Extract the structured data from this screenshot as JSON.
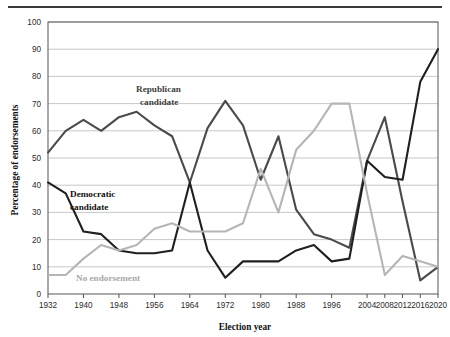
{
  "chart_data": {
    "type": "line",
    "title": "",
    "xlabel": "Election year",
    "ylabel": "Percentage of endorsements",
    "ylim": [
      0,
      100
    ],
    "ytick_step": 10,
    "yticks": [
      0,
      10,
      20,
      30,
      40,
      50,
      60,
      70,
      80,
      90,
      100
    ],
    "grid": true,
    "legend_position": "inline-annotations",
    "x": [
      1932,
      1936,
      1940,
      1944,
      1948,
      1952,
      1956,
      1960,
      1964,
      1968,
      1972,
      1976,
      1980,
      1984,
      1988,
      1992,
      1996,
      2000,
      2004,
      2008,
      2012,
      2016,
      2020
    ],
    "xticks": [
      1932,
      1940,
      1948,
      1956,
      1964,
      1972,
      1980,
      1988,
      1996,
      2004,
      2008,
      2012,
      2016,
      2020
    ],
    "xtick_labels": [
      "1932",
      "1940",
      "1948",
      "1956",
      "1964",
      "1972",
      "1980",
      "1988",
      "1996",
      "2004",
      "2008",
      "2012",
      "2016",
      "2020"
    ],
    "series": [
      {
        "name": "Republican candidate",
        "color": "#4a4a4a",
        "values": [
          52,
          60,
          64,
          60,
          65,
          67,
          62,
          58,
          41,
          61,
          71,
          62,
          42,
          58,
          31,
          22,
          20,
          17,
          49,
          65,
          34,
          5,
          10
        ]
      },
      {
        "name": "Democratic candidate",
        "color": "#1f1f1f",
        "values": [
          41,
          37,
          23,
          22,
          16,
          15,
          15,
          16,
          41,
          16,
          6,
          12,
          12,
          12,
          16,
          18,
          12,
          13,
          49,
          43,
          42,
          78,
          90
        ]
      },
      {
        "name": "No endorsement",
        "color": "#b5b5b5",
        "values": [
          7,
          7,
          13,
          18,
          16,
          18,
          24,
          26,
          23,
          23,
          23,
          26,
          46,
          30,
          53,
          60,
          70,
          70,
          37,
          7,
          14,
          12,
          10
        ]
      }
    ],
    "annotations": [
      {
        "text": "Republican candidate",
        "series": "Republican candidate"
      },
      {
        "text": "Democratic candidate",
        "series": "Democratic candidate"
      },
      {
        "text": "No endorsement",
        "series": "No endorsement"
      }
    ]
  },
  "axis": {
    "y_title": "Percentage of endorsements",
    "x_title": "Election year"
  },
  "labels": {
    "republican_line1": "Republican",
    "republican_line2": "candidate",
    "democratic_line1": "Democratic",
    "democratic_line2": "candidate",
    "no_endorsement": "No endorsement"
  }
}
